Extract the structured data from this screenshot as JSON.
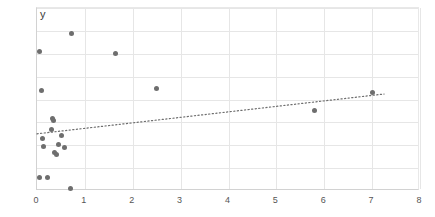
{
  "chart_data": {
    "type": "scatter",
    "title": "",
    "subtitle": "",
    "xlabel": "",
    "ylabel": "y",
    "xlim": [
      0,
      8
    ],
    "ylim": [
      0,
      4
    ],
    "xticks": [
      "0",
      "1",
      "2",
      "3",
      "4",
      "5",
      "6",
      "7",
      "8"
    ],
    "xtick_values": [
      0,
      1,
      2,
      3,
      4,
      5,
      6,
      7,
      8
    ],
    "yticks": [
      "0",
      "0,5",
      "1",
      "1,5",
      "2",
      "2,5",
      "3",
      "3,5",
      "4"
    ],
    "ytick_values": [
      0,
      0.5,
      1,
      1.5,
      2,
      2.5,
      3,
      3.5,
      4
    ],
    "grid": true,
    "legend": false,
    "decimal_separator": ",",
    "series": [
      {
        "name": "y",
        "marker": "circle",
        "color": "#6e6e6e",
        "points": [
          [
            0.05,
            3.05
          ],
          [
            0.05,
            0.3
          ],
          [
            0.1,
            2.2
          ],
          [
            0.12,
            1.15
          ],
          [
            0.14,
            0.98
          ],
          [
            0.22,
            0.3
          ],
          [
            0.3,
            1.35
          ],
          [
            0.33,
            1.58
          ],
          [
            0.35,
            1.55
          ],
          [
            0.36,
            0.85
          ],
          [
            0.4,
            0.8
          ],
          [
            0.45,
            1.02
          ],
          [
            0.52,
            1.22
          ],
          [
            0.58,
            0.95
          ],
          [
            0.7,
            0.05
          ],
          [
            0.72,
            3.45
          ],
          [
            1.65,
            3.0
          ],
          [
            2.5,
            2.25
          ],
          [
            5.8,
            1.75
          ],
          [
            7.0,
            2.15
          ]
        ]
      }
    ],
    "trendline": {
      "style": "dotted",
      "color": "#6e6e6e",
      "x_start": 0.0,
      "y_start": 1.25,
      "x_end": 7.25,
      "y_end": 2.12
    }
  }
}
